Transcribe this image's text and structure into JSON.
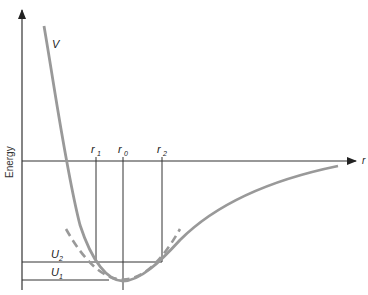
{
  "diagram": {
    "type": "potential-energy-curve",
    "y_axis_label": "Energy",
    "x_axis_label": "r",
    "curve_label": "V",
    "markers": [
      {
        "label": "r",
        "sub": "1",
        "x": 96
      },
      {
        "label": "r",
        "sub": "0",
        "x": 123
      },
      {
        "label": "r",
        "sub": "2",
        "x": 162
      }
    ],
    "levels": [
      {
        "label": "U",
        "sub": "2",
        "y": 262
      },
      {
        "label": "U",
        "sub": "1",
        "y": 280
      }
    ],
    "colors": {
      "curve": "#999999",
      "axis": "#222222",
      "dashed": "#999999"
    }
  }
}
